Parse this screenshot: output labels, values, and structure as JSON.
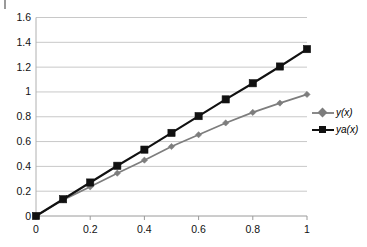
{
  "chart_data": {
    "type": "line",
    "title": "",
    "subtitle": "",
    "xlabel": "",
    "ylabel": "",
    "x": [
      0,
      0.1,
      0.2,
      0.3,
      0.4,
      0.5,
      0.6,
      0.7,
      0.8,
      0.9,
      1
    ],
    "series": [
      {
        "name": "y(x)",
        "color": "#7d7d7d",
        "marker": "diamond",
        "values": [
          0,
          0.13,
          0.235,
          0.345,
          0.45,
          0.56,
          0.655,
          0.75,
          0.835,
          0.91,
          0.98
        ]
      },
      {
        "name": "ya(x)",
        "color": "#111111",
        "marker": "square",
        "values": [
          0,
          0.135,
          0.27,
          0.405,
          0.535,
          0.67,
          0.805,
          0.94,
          1.07,
          1.205,
          1.345
        ]
      }
    ],
    "xlim": [
      0,
      1
    ],
    "ylim": [
      0,
      1.6
    ],
    "x_ticks": [
      0,
      0.2,
      0.4,
      0.6,
      0.8,
      1
    ],
    "x_tick_labels": [
      "0",
      "0.2",
      "0.4",
      "0.6",
      "0.8",
      "1"
    ],
    "y_ticks": [
      0,
      0.2,
      0.4,
      0.6,
      0.8,
      1,
      1.2,
      1.4,
      1.6
    ],
    "y_tick_labels": [
      "0",
      "0.2",
      "0.4",
      "0.6",
      "0.8",
      "1",
      "1.2",
      "1.4",
      "1.6"
    ],
    "grid": "horizontal",
    "grid_color": "#c8c8c8",
    "legend_position": "right",
    "legend": [
      "y(x)",
      "ya(x)"
    ],
    "plot_background": "#ffffff"
  },
  "legend": {
    "entries": [
      {
        "label": "y(x)",
        "marker": "diamond-marker-icon"
      },
      {
        "label": "ya(x)",
        "marker": "square-marker-icon"
      }
    ]
  },
  "axes": {
    "y_labels": [
      "1.6",
      "1.4",
      "1.2",
      "1",
      "0.8",
      "0.6",
      "0.4",
      "0.2",
      "0"
    ],
    "x_labels": [
      "0",
      "0.2",
      "0.4",
      "0.6",
      "0.8",
      "1"
    ]
  }
}
